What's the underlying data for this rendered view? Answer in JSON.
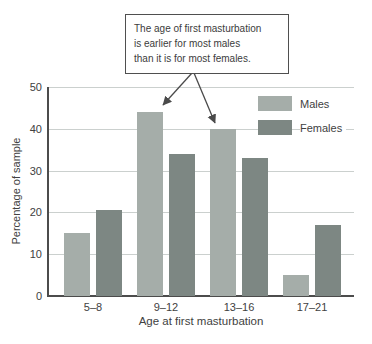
{
  "chart_data": {
    "type": "bar",
    "categories": [
      "5–8",
      "9–12",
      "13–16",
      "17–21"
    ],
    "series": [
      {
        "name": "Males",
        "color": "#a5ada9",
        "values": [
          15,
          44,
          40,
          5
        ]
      },
      {
        "name": "Females",
        "color": "#7d8783",
        "values": [
          20.5,
          34,
          33,
          17
        ]
      }
    ],
    "title": "",
    "xlabel": "Age at first masturbation",
    "ylabel": "Percentage of sample",
    "ylim": [
      0,
      50
    ],
    "yticks": [
      0,
      10,
      20,
      30,
      40,
      50
    ],
    "grid": true,
    "legend_position": "top-right"
  },
  "annotation": {
    "lines": [
      "The age of first masturbation",
      "is earlier for most males",
      "than it is for most females."
    ],
    "points_to": [
      "Males bar 9–12",
      "Males bar 13–16"
    ]
  },
  "colors": {
    "males_bar": "#a5ada9",
    "females_bar": "#7d8783",
    "gridline": "#cbd0ce",
    "axis": "#4c4c4c",
    "arrow": "#4a4a4a",
    "text": "#414141",
    "background": "#ffffff"
  }
}
